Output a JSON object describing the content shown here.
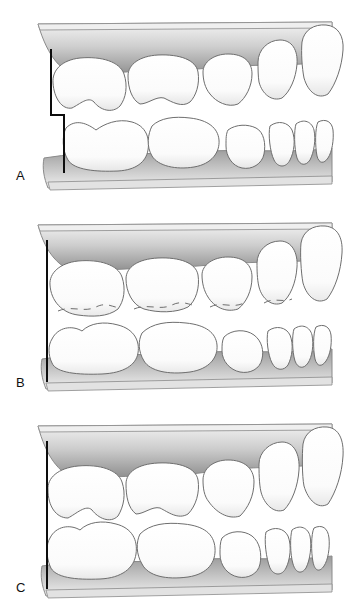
{
  "figure": {
    "background_color": "#ffffff",
    "panel_count": 3
  },
  "colors": {
    "tooth_fill": "#fdfdfd",
    "tooth_outline": "#6e6e6e",
    "tooth_shadow": "#cfcfcf",
    "gingiva_light": "#f2f2f2",
    "gingiva_mid": "#bdbdbd",
    "gingiva_dark": "#8f8f8f",
    "base_outline": "#8a8a8a",
    "reference_line": "#0d0d0d",
    "label_text": "#111111",
    "page_background": "#ffffff"
  },
  "panels": [
    {
      "id": "panel-a",
      "label": "A",
      "label_position": {
        "x": 16,
        "y": 174
      },
      "reference_line": {
        "type": "stepped",
        "upper_x": 51,
        "lower_x": 64,
        "top_y": 50,
        "step_y": 115,
        "bottom_y": 172,
        "stroke_width": 2
      },
      "upper_teeth_count": 6,
      "lower_teeth_count": 7,
      "occlusion_note": "teeth in contact, stepped reference line"
    },
    {
      "id": "panel-b",
      "label": "B",
      "label_position": {
        "x": 16,
        "y": 378
      },
      "reference_line": {
        "type": "straight",
        "upper_x": 47,
        "lower_x": 47,
        "top_y": 240,
        "step_y": 320,
        "bottom_y": 378,
        "stroke_width": 2
      },
      "upper_teeth_count": 6,
      "lower_teeth_count": 7,
      "occlusion_note": "open bite gap between arches, dashed cusp outlines"
    },
    {
      "id": "panel-c",
      "label": "C",
      "label_position": {
        "x": 16,
        "y": 580
      },
      "reference_line": {
        "type": "straight",
        "upper_x": 47,
        "lower_x": 47,
        "top_y": 444,
        "step_y": 520,
        "bottom_y": 580,
        "stroke_width": 2
      },
      "upper_teeth_count": 6,
      "lower_teeth_count": 7,
      "occlusion_note": "arches in light contact, straight reference line"
    }
  ]
}
